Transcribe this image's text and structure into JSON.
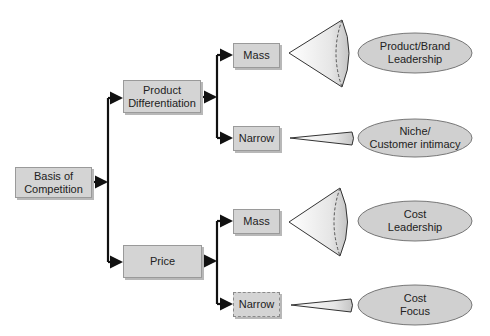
{
  "diagram": {
    "root": {
      "label": "Basis of\nCompetition",
      "line1": "Basis of",
      "line2": "Competition"
    },
    "branches": [
      {
        "label": "Product Differentiation",
        "line1": "Product",
        "line2": "Differentiation",
        "markets": [
          {
            "label": "Mass",
            "shape": "wide-cone",
            "outcome": {
              "line1": "Product/Brand",
              "line2": "Leadership"
            }
          },
          {
            "label": "Narrow",
            "shape": "narrow-cone",
            "outcome": {
              "line1": "Niche/",
              "line2": "Customer intimacy"
            }
          }
        ]
      },
      {
        "label": "Price",
        "line1": "Price",
        "markets": [
          {
            "label": "Mass",
            "shape": "wide-cone",
            "outcome": {
              "line1": "Cost",
              "line2": "Leadership"
            }
          },
          {
            "label": "Narrow",
            "shape": "narrow-cone",
            "dashed": true,
            "outcome": {
              "line1": "Cost",
              "line2": "Focus"
            }
          }
        ]
      }
    ]
  },
  "colors": {
    "box_fill": "#d4d4d4",
    "oval_fill": "#d0d0d0",
    "line": "#111111"
  }
}
